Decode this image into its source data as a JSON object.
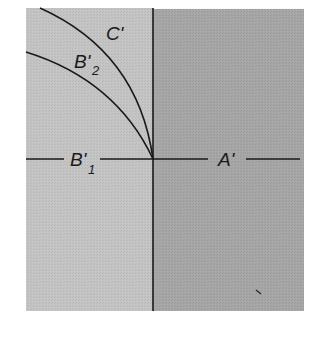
{
  "diagram": {
    "type": "quadrant-curve-diagram",
    "colors": {
      "background": "#ffffff",
      "left_panel": "#c4c4c4",
      "right_panel": "#a6a6a6",
      "lines": "#1a1a1a"
    },
    "axes": {
      "horizontal_left_label": "B'",
      "horizontal_left_subscript": "1",
      "horizontal_right_label": "A'"
    },
    "curves": [
      {
        "name": "C'",
        "label": "C'",
        "subscript": ""
      },
      {
        "name": "B'2",
        "label": "B'",
        "subscript": "2"
      }
    ]
  }
}
